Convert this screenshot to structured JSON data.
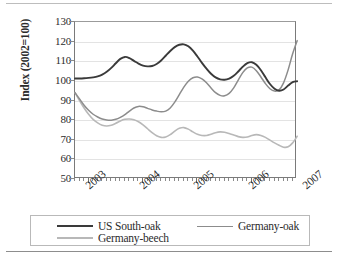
{
  "chart_data": {
    "type": "line",
    "title": "",
    "subtitle": "",
    "xlabel": "",
    "ylabel": "Index (2002=100)",
    "ylim": [
      50,
      130
    ],
    "yticks": [
      50,
      60,
      70,
      80,
      90,
      100,
      110,
      120,
      130
    ],
    "ytick_labels": [
      "50",
      "60",
      "70",
      "80",
      "90",
      "100",
      "110",
      "120",
      "130"
    ],
    "grid": "horizontal",
    "legend_position": "below-plot",
    "xlim": [
      2002.75,
      2006.83
    ],
    "xtick_labels": [
      "2003",
      "2004",
      "2005",
      "2006",
      "2007"
    ],
    "xticks": [
      2003,
      2004,
      2005,
      2006,
      2007
    ],
    "x": [
      2002.75,
      2002.833,
      2002.917,
      2003.0,
      2003.083,
      2003.167,
      2003.25,
      2003.333,
      2003.417,
      2003.5,
      2003.583,
      2003.667,
      2003.75,
      2003.833,
      2003.917,
      2004.0,
      2004.083,
      2004.167,
      2004.25,
      2004.333,
      2004.417,
      2004.5,
      2004.583,
      2004.667,
      2004.75,
      2004.833,
      2004.917,
      2005.0,
      2005.083,
      2005.167,
      2005.25,
      2005.333,
      2005.417,
      2005.5,
      2005.583,
      2005.667,
      2005.75,
      2005.833,
      2005.917,
      2006.0,
      2006.083,
      2006.167,
      2006.25,
      2006.333,
      2006.417,
      2006.5,
      2006.583,
      2006.667,
      2006.75,
      2006.833
    ],
    "series": [
      {
        "name": "US South-oak",
        "color": "#3a3a3a",
        "width": 1.9,
        "values": [
          101.2,
          101.2,
          101.3,
          101.5,
          101.8,
          102.3,
          103.2,
          104.6,
          106.6,
          109.0,
          111.2,
          112.2,
          111.6,
          110.2,
          108.8,
          107.8,
          107.4,
          107.6,
          108.6,
          110.4,
          112.8,
          115.2,
          117.2,
          118.4,
          118.6,
          117.6,
          115.4,
          112.4,
          109.2,
          106.2,
          103.6,
          101.8,
          100.8,
          100.6,
          101.2,
          102.6,
          104.8,
          107.2,
          109.0,
          109.5,
          108.2,
          105.4,
          101.8,
          98.4,
          96.0,
          95.0,
          95.6,
          97.6,
          99.4,
          99.8
        ]
      },
      {
        "name": "Germany-oak",
        "color": "#8c8c8c",
        "width": 1.5,
        "values": [
          94.0,
          90.8,
          87.6,
          85.0,
          83.0,
          81.6,
          80.6,
          80.1,
          80.0,
          80.4,
          81.4,
          82.8,
          84.6,
          86.2,
          87.0,
          86.8,
          86.0,
          85.2,
          84.6,
          84.3,
          84.6,
          86.2,
          89.2,
          93.0,
          96.8,
          99.8,
          101.6,
          102.0,
          101.0,
          99.0,
          96.4,
          94.0,
          92.6,
          92.4,
          93.6,
          96.4,
          100.4,
          104.2,
          106.6,
          107.0,
          105.2,
          102.0,
          98.6,
          96.0,
          94.8,
          95.4,
          99.0,
          105.6,
          113.8,
          120.5
        ]
      },
      {
        "name": "Germany-beech",
        "color": "#b8b8b8",
        "width": 1.6,
        "values": [
          94.0,
          90.0,
          86.2,
          83.0,
          80.4,
          78.6,
          77.4,
          77.0,
          77.4,
          78.4,
          79.6,
          80.4,
          80.6,
          80.2,
          79.2,
          77.6,
          75.6,
          73.6,
          72.0,
          71.2,
          71.4,
          72.6,
          74.4,
          75.8,
          76.2,
          75.4,
          74.0,
          72.8,
          72.2,
          72.2,
          72.8,
          73.6,
          74.0,
          73.8,
          73.2,
          72.4,
          71.6,
          71.2,
          71.4,
          72.2,
          72.6,
          72.2,
          71.2,
          69.8,
          68.4,
          67.2,
          66.2,
          66.4,
          68.4,
          71.8
        ]
      }
    ]
  },
  "axis": {
    "y_title": "Index (2002=100)"
  },
  "legend": {
    "entries": [
      {
        "label": "US South-oak",
        "color": "#3a3a3a"
      },
      {
        "label": "Germany-oak",
        "color": "#8c8c8c"
      },
      {
        "label": "Germany-beech",
        "color": "#b8b8b8"
      }
    ]
  }
}
